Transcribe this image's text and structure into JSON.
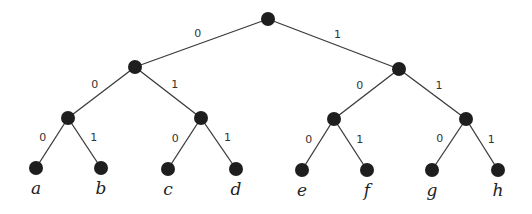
{
  "diagram": {
    "type": "binary-code-tree",
    "nodes": [
      {
        "id": "root"
      },
      {
        "id": "n0"
      },
      {
        "id": "n1"
      },
      {
        "id": "n00"
      },
      {
        "id": "n01"
      },
      {
        "id": "n10"
      },
      {
        "id": "n11"
      },
      {
        "id": "a",
        "label": "a"
      },
      {
        "id": "b",
        "label": "b"
      },
      {
        "id": "c",
        "label": "c"
      },
      {
        "id": "d",
        "label": "d"
      },
      {
        "id": "e",
        "label": "e"
      },
      {
        "id": "f",
        "label": "f"
      },
      {
        "id": "g",
        "label": "g"
      },
      {
        "id": "h",
        "label": "h"
      }
    ],
    "edges": [
      {
        "from": "root",
        "to": "n0",
        "bit": "0"
      },
      {
        "from": "root",
        "to": "n1",
        "bit": "1"
      },
      {
        "from": "n0",
        "to": "n00",
        "bit": "0"
      },
      {
        "from": "n0",
        "to": "n01",
        "bit": "1"
      },
      {
        "from": "n1",
        "to": "n10",
        "bit": "0"
      },
      {
        "from": "n1",
        "to": "n11",
        "bit": "1"
      },
      {
        "from": "n00",
        "to": "a",
        "bit": "0"
      },
      {
        "from": "n00",
        "to": "b",
        "bit": "1"
      },
      {
        "from": "n01",
        "to": "c",
        "bit": "0"
      },
      {
        "from": "n01",
        "to": "d",
        "bit": "1"
      },
      {
        "from": "n10",
        "to": "e",
        "bit": "0"
      },
      {
        "from": "n10",
        "to": "f",
        "bit": "1"
      },
      {
        "from": "n11",
        "to": "g",
        "bit": "0"
      },
      {
        "from": "n11",
        "to": "h",
        "bit": "1"
      }
    ]
  }
}
